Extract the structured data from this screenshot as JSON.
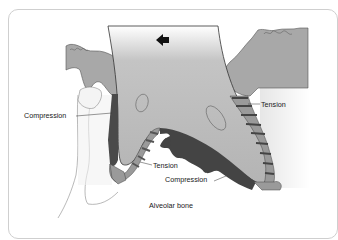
{
  "figure": {
    "direction_arrow": "left-arrow-icon",
    "labels": {
      "compression_left": "Compression",
      "tension_right": "Tension",
      "tension_bottom": "Tension",
      "compression_bottom": "Compression",
      "alveolar_bone": "Alveolar bone"
    },
    "colors": {
      "tooth_root": "#b8b8b8",
      "gingiva": "#a6a6a6",
      "compression_zone": "#4a4a4a",
      "tension_fibers": "#555555",
      "tension_ligament": "#9a9a9a",
      "background": "#ffffff"
    }
  }
}
